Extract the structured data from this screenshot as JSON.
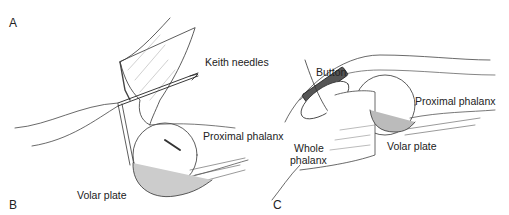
{
  "figure": {
    "panels": [
      {
        "id": "A",
        "label": "A"
      },
      {
        "id": "B",
        "label": "B"
      },
      {
        "id": "C",
        "label": "C"
      }
    ],
    "labels": {
      "keith_needles": "Keith needles",
      "proximal_phalanx_left": "Proximal phalanx",
      "volar_plate_left": "Volar plate",
      "button": "Button",
      "proximal_phalanx_right": "Proximal phalanx",
      "whole_phalanx_line1": "Whole",
      "whole_phalanx_line2": "phalanx",
      "volar_plate_right": "Volar plate"
    }
  }
}
